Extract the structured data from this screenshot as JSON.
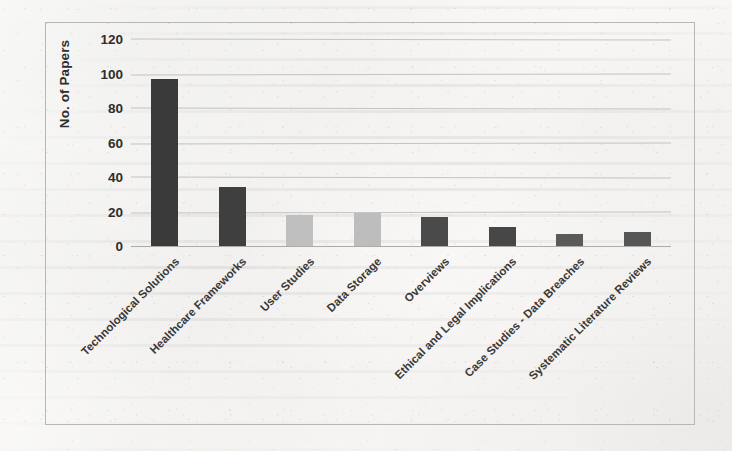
{
  "document": {
    "media": "scanned-page",
    "figure_border_color": "#b9b7b4",
    "page_background": "#f8f7f5"
  },
  "chart_data": {
    "type": "bar",
    "title": "",
    "xlabel": "",
    "ylabel": "No. of Papers",
    "ylim": [
      0,
      120
    ],
    "ytick_labels": [
      "0",
      "20",
      "40",
      "60",
      "80",
      "100",
      "120"
    ],
    "ytick_values": [
      0,
      20,
      40,
      60,
      80,
      100,
      120
    ],
    "grid": true,
    "grid_axis": "y",
    "legend": "none",
    "orientation": "vertical",
    "xtick_rotation_degrees": -45,
    "categories": [
      "Technological Solutions",
      "Healthcare Frameworks",
      "User Studies",
      "Data Storage",
      "Overviews",
      "Ethical and Legal Implications",
      "Case Studies - Data Breaches",
      "Systematic Literature Reviews"
    ],
    "values": [
      97,
      34,
      18,
      19,
      17,
      11,
      7,
      8
    ],
    "bar_colors": [
      "#3a3a3a",
      "#3f3f3f",
      "#bfbfbf",
      "#bdbdbd",
      "#4a4a4a",
      "#474747",
      "#5a5a5a",
      "#565656"
    ]
  },
  "colors": {
    "bar_dark": "#3a3a3a",
    "bar_light": "#bfbfbf",
    "gridline": "#c2c0bd",
    "axis_text": "#2e2d2b",
    "label_text": "#3a3835"
  }
}
